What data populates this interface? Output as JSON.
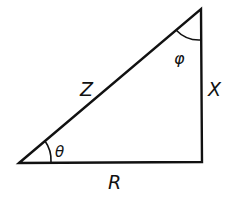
{
  "diagram": {
    "type": "right-triangle",
    "stroke_color": "#111111",
    "background": "#ffffff",
    "vertices": {
      "bottom_left": [
        19,
        163
      ],
      "top_right": [
        201,
        9
      ],
      "bottom_right": [
        202,
        162
      ]
    },
    "sides": {
      "hypotenuse": "Z",
      "vertical": "X",
      "horizontal": "R"
    },
    "angles": {
      "bottom_left": "θ",
      "top": "φ"
    }
  }
}
